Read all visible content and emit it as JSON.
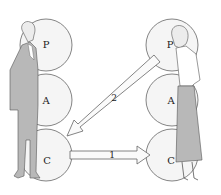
{
  "diagram": {
    "left_person": {
      "figure": "man-in-suit",
      "ego_states": [
        "P",
        "A",
        "C"
      ]
    },
    "right_person": {
      "figure": "woman-in-skirt",
      "ego_states": [
        "P",
        "A",
        "C"
      ]
    },
    "arrows": [
      {
        "label": "1",
        "from": "left.C",
        "to": "right.C"
      },
      {
        "label": "2",
        "from": "right.P",
        "to": "left.C"
      }
    ],
    "colors": {
      "circle_fill": "#f4f4f4",
      "stroke": "#555555",
      "figure_fill": "#b8b8b8"
    }
  }
}
